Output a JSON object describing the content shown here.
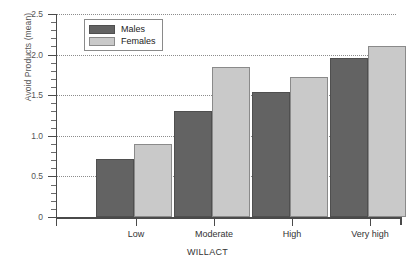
{
  "chart_data": {
    "type": "bar",
    "title": "",
    "xlabel": "WILLACT",
    "ylabel": "Avoid Products (mean)",
    "categories": [
      "Low",
      "Moderate",
      "High",
      "Very high"
    ],
    "series": [
      {
        "name": "Males",
        "color": "#636363",
        "values": [
          0.71,
          1.31,
          1.54,
          1.96
        ]
      },
      {
        "name": "Females",
        "color": "#c9c9c9",
        "values": [
          0.9,
          1.85,
          1.72,
          2.1
        ]
      }
    ],
    "ylim": [
      0,
      2.5
    ],
    "ytick_labels": [
      "0",
      "0.5",
      "1.0",
      "1.5",
      "2.0",
      "2.5"
    ],
    "ytick_values": [
      0,
      0.5,
      1.0,
      1.5,
      2.0,
      2.5
    ],
    "ytick_minor_step": 0.1,
    "grid": "horizontal-dotted",
    "legend_position": "top-left-inside"
  },
  "legend": {
    "items": [
      {
        "label": "Males",
        "swatch": "dark-gray-swatch"
      },
      {
        "label": "Females",
        "swatch": "light-gray-swatch"
      }
    ]
  }
}
